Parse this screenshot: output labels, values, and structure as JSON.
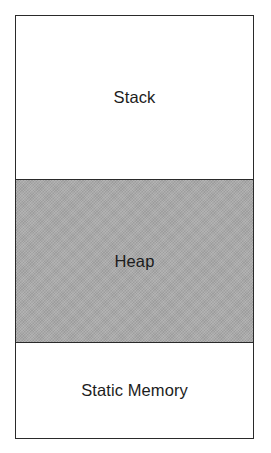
{
  "diagram": {
    "type": "memory-layout",
    "segments": [
      {
        "id": "stack",
        "label": "Stack",
        "fill": "#ffffff"
      },
      {
        "id": "heap",
        "label": "Heap",
        "fill": "#aaaaaa"
      },
      {
        "id": "static",
        "label": "Static Memory",
        "fill": "#ffffff"
      }
    ],
    "colors": {
      "border": "#2a2a2a",
      "text": "#1c1c1c",
      "heap_fill": "#aaaaaa",
      "background": "#ffffff"
    }
  }
}
